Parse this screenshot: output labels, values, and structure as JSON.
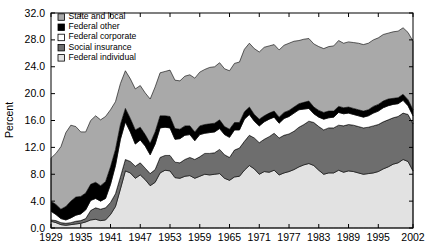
{
  "chart_data": {
    "type": "area",
    "stacked": true,
    "title": "",
    "xlabel": "",
    "ylabel": "Percent",
    "xlim": [
      1929,
      2002
    ],
    "ylim": [
      0,
      32
    ],
    "ytick_labels": [
      "0.0",
      "4.0",
      "8.0",
      "12.0",
      "16.0",
      "20.0",
      "24.0",
      "28.0",
      "32.0"
    ],
    "ytick_values": [
      0,
      4,
      8,
      12,
      16,
      20,
      24,
      28,
      32
    ],
    "xtick_labels": [
      "1929",
      "1935",
      "1941",
      "1947",
      "1953",
      "1959",
      "1965",
      "1971",
      "1977",
      "1983",
      "1989",
      "1995",
      "2002"
    ],
    "xtick_values": [
      1929,
      1935,
      1941,
      1947,
      1953,
      1959,
      1965,
      1971,
      1977,
      1983,
      1989,
      1995,
      2002
    ],
    "grid": false,
    "legend_position": "top-left",
    "legend_order_top_to_bottom": [
      "State and local",
      "Federal other",
      "Federal corporate",
      "Social insurance",
      "Federal individual"
    ],
    "stack_order_bottom_to_top": [
      "Federal individual",
      "Social insurance",
      "Federal corporate",
      "Federal other",
      "State and local"
    ],
    "colors": {
      "State and local": "#a9a9a9",
      "Federal other": "#000000",
      "Federal corporate": "#ffffff",
      "Social insurance": "#6e6e6e",
      "Federal individual": "#e2e2e2"
    },
    "x": [
      1929,
      1930,
      1931,
      1932,
      1933,
      1934,
      1935,
      1936,
      1937,
      1938,
      1939,
      1940,
      1941,
      1942,
      1943,
      1944,
      1945,
      1946,
      1947,
      1948,
      1949,
      1950,
      1951,
      1952,
      1953,
      1954,
      1955,
      1956,
      1957,
      1958,
      1959,
      1960,
      1961,
      1962,
      1963,
      1964,
      1965,
      1966,
      1967,
      1968,
      1969,
      1970,
      1971,
      1972,
      1973,
      1974,
      1975,
      1976,
      1977,
      1978,
      1979,
      1980,
      1981,
      1982,
      1983,
      1984,
      1985,
      1986,
      1987,
      1988,
      1989,
      1990,
      1991,
      1992,
      1993,
      1994,
      1995,
      1996,
      1997,
      1998,
      1999,
      2000,
      2001,
      2002
    ],
    "series": [
      {
        "name": "Federal individual",
        "values": [
          1.0,
          0.8,
          0.5,
          0.4,
          0.5,
          0.6,
          0.7,
          0.9,
          1.2,
          1.3,
          1.1,
          1.2,
          2.0,
          3.2,
          5.8,
          8.5,
          8.2,
          7.4,
          7.9,
          7.2,
          6.3,
          6.8,
          8.2,
          8.6,
          8.5,
          7.5,
          7.4,
          7.7,
          7.8,
          7.4,
          7.7,
          8.0,
          7.9,
          8.0,
          8.1,
          7.4,
          7.1,
          7.6,
          7.7,
          8.6,
          9.3,
          8.8,
          8.0,
          8.4,
          8.3,
          8.6,
          7.9,
          8.2,
          8.4,
          8.7,
          9.1,
          9.4,
          9.6,
          9.3,
          8.6,
          8.0,
          8.2,
          8.2,
          8.6,
          8.3,
          8.5,
          8.4,
          8.2,
          8.0,
          8.1,
          8.2,
          8.4,
          8.8,
          9.1,
          9.5,
          9.7,
          10.2,
          9.9,
          8.5
        ]
      },
      {
        "name": "Social insurance",
        "values": [
          0.2,
          0.3,
          0.3,
          0.3,
          0.3,
          0.4,
          0.4,
          0.5,
          1.4,
          1.7,
          1.7,
          1.8,
          1.8,
          1.9,
          1.8,
          1.7,
          1.7,
          1.8,
          1.8,
          1.7,
          1.8,
          1.9,
          2.3,
          2.2,
          2.3,
          2.3,
          2.3,
          2.5,
          2.7,
          2.8,
          2.9,
          3.1,
          3.2,
          3.2,
          3.6,
          3.5,
          3.4,
          4.0,
          4.2,
          4.3,
          4.5,
          4.6,
          4.7,
          4.8,
          5.3,
          5.5,
          5.5,
          5.6,
          5.6,
          5.7,
          5.9,
          6.0,
          6.3,
          6.4,
          6.5,
          6.6,
          6.7,
          6.7,
          6.7,
          6.9,
          6.9,
          6.9,
          6.9,
          6.9,
          6.9,
          7.0,
          7.0,
          7.0,
          7.0,
          6.9,
          6.9,
          6.9,
          7.0,
          7.0
        ]
      },
      {
        "name": "Federal corporate",
        "values": [
          1.3,
          0.9,
          0.6,
          0.5,
          0.7,
          0.9,
          1.0,
          1.3,
          1.5,
          1.4,
          1.2,
          1.4,
          2.7,
          4.2,
          5.6,
          5.6,
          4.4,
          3.3,
          3.4,
          3.3,
          2.8,
          3.8,
          4.4,
          4.2,
          4.1,
          3.4,
          3.6,
          3.6,
          3.4,
          2.8,
          3.3,
          3.0,
          3.1,
          3.1,
          3.1,
          3.0,
          3.0,
          3.0,
          2.7,
          3.3,
          3.1,
          2.5,
          2.5,
          2.6,
          2.6,
          2.4,
          2.2,
          2.5,
          2.6,
          2.7,
          2.6,
          2.3,
          1.9,
          1.3,
          1.4,
          1.6,
          1.5,
          1.6,
          1.9,
          1.8,
          1.7,
          1.6,
          1.6,
          1.6,
          1.7,
          1.9,
          2.0,
          2.1,
          2.1,
          2.0,
          1.9,
          1.9,
          1.3,
          1.2
        ]
      },
      {
        "name": "Federal other",
        "values": [
          1.5,
          1.5,
          1.4,
          2.0,
          2.5,
          2.7,
          2.6,
          2.5,
          2.4,
          2.4,
          2.3,
          2.5,
          2.6,
          2.4,
          2.2,
          2.0,
          2.0,
          2.1,
          1.9,
          1.7,
          1.7,
          1.8,
          1.8,
          1.7,
          1.7,
          1.6,
          1.4,
          1.4,
          1.3,
          1.3,
          1.3,
          1.3,
          1.3,
          1.3,
          1.3,
          1.2,
          1.2,
          1.1,
          1.1,
          1.1,
          1.1,
          1.0,
          1.0,
          0.9,
          0.9,
          0.9,
          0.9,
          0.9,
          0.9,
          0.9,
          0.9,
          1.0,
          1.1,
          1.0,
          1.0,
          1.0,
          1.0,
          0.9,
          0.9,
          0.9,
          0.9,
          0.9,
          0.9,
          0.9,
          0.9,
          1.0,
          1.0,
          1.0,
          1.0,
          0.9,
          0.9,
          0.9,
          0.9,
          0.9
        ]
      },
      {
        "name": "State and local",
        "values": [
          6.4,
          7.6,
          9.3,
          11.0,
          11.3,
          10.5,
          9.6,
          9.1,
          9.5,
          9.9,
          9.8,
          9.7,
          8.5,
          7.1,
          6.1,
          5.6,
          5.9,
          6.1,
          6.2,
          6.2,
          6.6,
          6.7,
          6.4,
          6.6,
          6.9,
          7.2,
          7.2,
          7.4,
          7.6,
          8.0,
          8.0,
          8.2,
          8.4,
          8.4,
          8.5,
          8.6,
          8.7,
          8.8,
          9.0,
          9.3,
          9.5,
          9.8,
          10.0,
          10.2,
          10.0,
          9.9,
          10.0,
          10.0,
          10.0,
          9.8,
          9.4,
          9.4,
          9.3,
          9.4,
          9.5,
          9.5,
          9.6,
          9.7,
          9.8,
          9.6,
          9.7,
          9.8,
          9.9,
          9.9,
          9.9,
          9.9,
          9.9,
          9.9,
          9.8,
          9.9,
          9.9,
          9.9,
          10.0,
          10.2
        ]
      }
    ]
  },
  "axes": {
    "ylabel": "Percent"
  }
}
